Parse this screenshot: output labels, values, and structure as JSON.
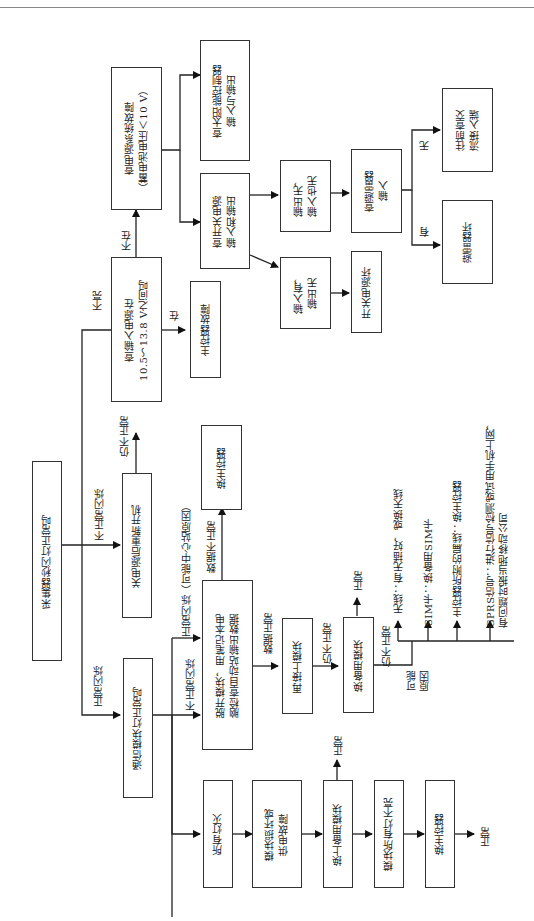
{
  "diagram": {
    "orientation": "rotated 90 degrees counter-clockwise",
    "nodes": {
      "start": "采集器秒闪灯正常吗",
      "comm_ok": "通信模块灯正常吗",
      "restart": "关电源后重新开机",
      "check_input": "查输入电源在\n10.5～13.8 V之间吗",
      "main_ctrl_fault": "主控器故障",
      "power_sys_fault": "查电源系统故障\n（蓄电池电压＜10 V）",
      "solar_ctrl": "查太阳能控制器\n输入与输出",
      "switch_psu": "查开关电源\n输入和输出",
      "out_none_in_none": "输出无，\n输入也无",
      "in_yes_out_none": "输入有，\n输出无",
      "psu_broken": "开关电源坏",
      "check_arrester": "查避雷器\n输入",
      "check_ac": "往前查交\n流接入端",
      "arrester_broken": "避雷器坏",
      "unplug_module": "脱开模块，用笔记本电\n脑检查自动站输出数据",
      "replace_main_ctrl_1": "换主控器",
      "reconnect_module": "再接上模块",
      "replace_spare_module": "换备用模块",
      "all_off": "所有灯灭",
      "module_or_power": "模块损坏或\n供电故障",
      "install_spare": "换上备用模块",
      "module_lights_off": "模块所有灯不亮",
      "replace_main_ctrl_2": "换主控器"
    },
    "edge_labels": {
      "normal_flash": "正常闪烁",
      "abnormal_flash": "不正常闪烁",
      "still_abnormal": "仍不正常",
      "not_lit": "不亮",
      "in_range": "在",
      "not_in_range": "不在",
      "none": "无",
      "has": "有",
      "normal_flash_center": "正常闪烁（可能中心站原因）",
      "not_normal_flash": "不正常闪烁",
      "data_abnormal": "数据不正常",
      "data_normal": "数据正常",
      "still_abnormal_2": "仍不正常",
      "still_abnormal_3": "仍不正常",
      "normal_1": "正常",
      "normal_2": "正常",
      "normal_3": "正常",
      "possible_causes": "可能\n原因"
    },
    "causes": [
      "无线：有无插好，或换天线",
      "SIM卡：换备用SIM卡",
      "主控器所附的扁线：换主控器",
      "GPRS信号：进行信号检测或试用手机上网，\n有问题时报当地移动公司"
    ]
  }
}
